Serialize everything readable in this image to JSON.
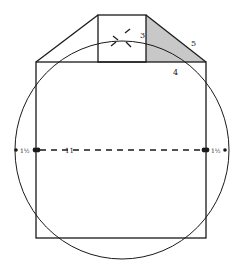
{
  "diagram": {
    "type": "geometric-construction",
    "labels": {
      "label_3": "3",
      "label_4": "4",
      "label_5": "5",
      "label_11": "11",
      "label_left_fraction": "1½",
      "label_right_fraction": "1½"
    },
    "colors": {
      "stroke": "#1a1a1a",
      "shade": "#c8c8c8",
      "background": "#ffffff"
    }
  }
}
